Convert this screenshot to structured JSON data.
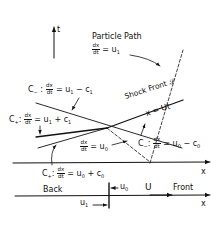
{
  "diagram": {
    "t_axis_label": "t",
    "particle_path": {
      "title": "Particle Path",
      "num": "dx",
      "den": "dt",
      "rhs": "= u",
      "sub": "1"
    },
    "c_minus_1": {
      "name": "C",
      "name_sub": "−",
      "colon": ":",
      "num": "dx",
      "den": "dt",
      "rhs_a": "= u",
      "rhs_a_sub": "1",
      "rhs_b": " − c",
      "rhs_b_sub": "1"
    },
    "c_plus_1": {
      "name": "C",
      "name_sub": "+",
      "colon": ":",
      "num": "dx",
      "den": "dt",
      "rhs_a": "= u",
      "rhs_a_sub": "1",
      "rhs_b": " + c",
      "rhs_b_sub": "1"
    },
    "shock_front": {
      "label": "Shock  Front",
      "symbol": "𝒮",
      "equation": "x = Ut"
    },
    "u0_path": {
      "num": "dx",
      "den": "dt",
      "rhs": "= u",
      "sub": "0"
    },
    "c_minus_0": {
      "name": "C",
      "name_sub": "−",
      "colon": ":",
      "num": "dx",
      "den": "dt",
      "rhs_a": "= u",
      "rhs_a_sub": "0",
      "rhs_b": " − c",
      "rhs_b_sub": "0"
    },
    "c_plus_0": {
      "name": "C",
      "name_sub": "+",
      "colon": ":",
      "num": "dx",
      "den": "dt",
      "rhs_a": "= u",
      "rhs_a_sub": "0",
      "rhs_b": " + c",
      "rhs_b_sub": "0"
    },
    "x_axis_label_upper": "x",
    "x_axis_label_lower": "x",
    "lower": {
      "back": "Back",
      "front": "Front",
      "u0": "u",
      "u0_sub": "0",
      "U": "U",
      "u1": "u",
      "u1_sub": "1"
    }
  }
}
